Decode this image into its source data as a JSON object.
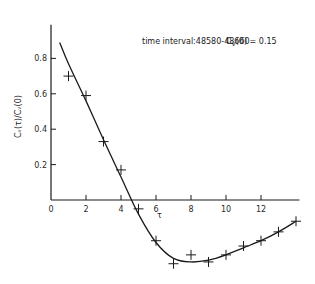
{
  "chart_data": {
    "type": "scatter",
    "annotation": "C_v(0) = 0.15",
    "xlabel": "τ",
    "ylabel": "C_v(τ)/C_v(0)",
    "xlim": [
      0,
      14
    ],
    "ylim": [
      -0.4,
      1.0
    ],
    "xticks": [
      0,
      2,
      4,
      6,
      8,
      10,
      12
    ],
    "yticks": [
      0.2,
      0.4,
      0.6,
      0.8
    ],
    "grid": false,
    "legend": null,
    "series": [
      {
        "name": "measured",
        "marker": "+",
        "x": [
          1,
          2,
          3,
          4,
          5,
          6,
          7,
          8,
          9,
          10,
          11,
          12,
          13,
          14
        ],
        "values": [
          0.7,
          0.59,
          0.33,
          0.17,
          -0.05,
          -0.23,
          -0.36,
          -0.31,
          -0.35,
          -0.31,
          -0.26,
          -0.23,
          -0.18,
          -0.12
        ]
      },
      {
        "name": "fit",
        "style": "line",
        "x": [
          0.5,
          1,
          2,
          3,
          4,
          5,
          6,
          7,
          8,
          9,
          10,
          11,
          12,
          13,
          14
        ],
        "values": [
          0.89,
          0.77,
          0.56,
          0.34,
          0.13,
          -0.08,
          -0.24,
          -0.33,
          -0.35,
          -0.34,
          -0.31,
          -0.27,
          -0.23,
          -0.18,
          -0.12
        ]
      }
    ]
  },
  "labels": {
    "title": "time interval:48580-48660",
    "annotation_lhs": "C",
    "annotation_sub": "V",
    "annotation_rhs": "(0) = 0.15",
    "xlabel": "τ",
    "ylabel": "Cᵥ(τ)/Cᵥ(0)"
  }
}
